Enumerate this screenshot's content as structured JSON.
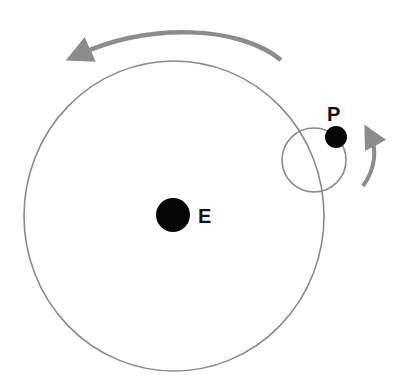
{
  "diagram": {
    "labels": {
      "earth": "E",
      "planet": "P"
    },
    "colors": {
      "orbit": "#8a8a8a",
      "arrow": "#8c8c8c",
      "body": "#050505",
      "text": "#111111"
    },
    "elements": {
      "deferent": {
        "cx": 174,
        "cy": 216,
        "rx": 150,
        "ry": 155
      },
      "epicycle": {
        "cx": 314,
        "cy": 160,
        "r": 32
      },
      "earth_body": {
        "cx": 173,
        "cy": 215,
        "r": 17
      },
      "planet_body": {
        "cx": 336,
        "cy": 137,
        "r": 11
      },
      "deferent_arrow": {
        "direction": "counterclockwise"
      },
      "epicycle_arrow": {
        "direction": "counterclockwise"
      }
    }
  }
}
